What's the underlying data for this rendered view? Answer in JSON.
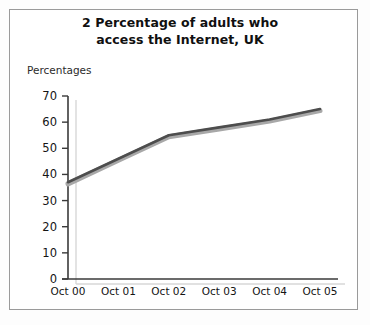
{
  "figure": {
    "title_line_1": "2 Percentage of adults who",
    "title_line_2": "access the Internet, UK",
    "y_axis_label": "Percentages"
  },
  "chart_data": {
    "type": "line",
    "title": "2 Percentage of adults who access the Internet, UK",
    "xlabel": "",
    "ylabel": "Percentages",
    "categories": [
      "Oct 00",
      "Oct 01",
      "Oct 02",
      "Oct 03",
      "Oct 04",
      "Oct 05"
    ],
    "values": [
      37,
      46,
      55,
      58,
      61,
      65
    ],
    "ylim": [
      0,
      70
    ],
    "y_ticks": [
      0,
      10,
      20,
      30,
      40,
      50,
      60,
      70
    ],
    "y_tick_labels": [
      "0",
      "10",
      "20",
      "30",
      "40",
      "50",
      "60",
      "70"
    ],
    "x_tick_labels": [
      "Oct 00",
      "Oct 01",
      "Oct 02",
      "Oct 03",
      "Oct 04",
      "Oct 05"
    ],
    "grid": false,
    "legend": null,
    "series": [
      {
        "name": "Percentage of adults who access the Internet",
        "values": [
          37,
          46,
          55,
          58,
          61,
          65
        ],
        "color": "#4d4d4d",
        "shadow_color": "#a8a8a8"
      }
    ]
  },
  "colors": {
    "line": "#4d4d4d",
    "line_shadow": "#a8a8a8",
    "axis": "#3a3a3a",
    "axis_depth": "#cfcfcf",
    "frame": "#9a9a9a",
    "text": "#141414",
    "background": "#ffffff"
  }
}
